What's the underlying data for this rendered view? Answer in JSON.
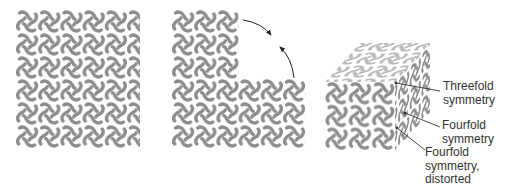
{
  "colors": {
    "motif": "#8c8c8c",
    "motif_faded": "#b5b5b5",
    "arrow": "#222222",
    "leader": "#333333",
    "text": "#333333"
  },
  "panels": [
    {
      "id": "flat-sheet",
      "description": "square lattice of pinwheel motifs",
      "columns": 5.6,
      "rows": 6
    },
    {
      "id": "folding-sheet",
      "description": "sheet with upper-right corner removed, arrows indicating folding",
      "upper_block": {
        "columns": 3,
        "rows": 3
      },
      "lower_block": {
        "columns": 6,
        "rows": 3
      },
      "arrows": 2
    },
    {
      "id": "cube",
      "description": "cube of motifs showing three symmetry faces",
      "front": {
        "columns": 3,
        "rows": 3
      }
    }
  ],
  "labels": [
    {
      "id": "threefold",
      "lines": [
        "Threefold",
        "symmetry"
      ]
    },
    {
      "id": "fourfold",
      "lines": [
        "Fourfold",
        "symmetry"
      ]
    },
    {
      "id": "fourfold-distorted",
      "lines": [
        "Fourfold",
        "symmetry,",
        "distorted"
      ]
    }
  ]
}
